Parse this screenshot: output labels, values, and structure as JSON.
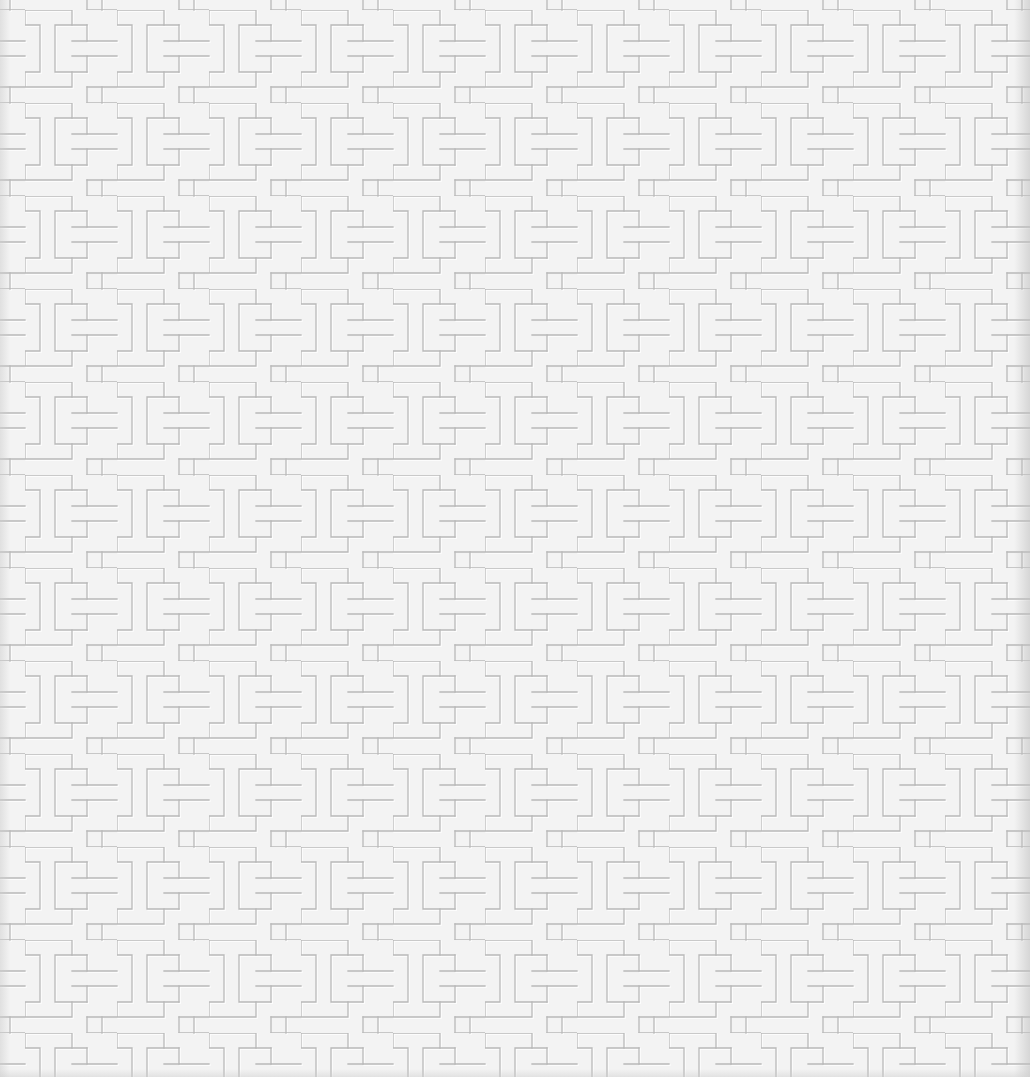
{
  "image": {
    "description": "Embossed white paper texture with repeating interlocking T / I-beam key pattern",
    "background_color": "#f3f3f3",
    "line_color": "#b9b9b9",
    "highlight_color": "#ffffff",
    "tile_period_x": 92,
    "tile_period_y": 93,
    "motif": "interlocking-t-key"
  }
}
